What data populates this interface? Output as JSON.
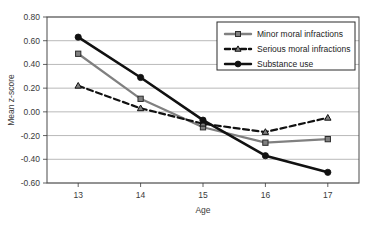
{
  "chart_data": {
    "type": "line",
    "title": "",
    "xlabel": "Age",
    "ylabel": "Mean z-score",
    "categories": [
      "13",
      "14",
      "15",
      "16",
      "17"
    ],
    "x": [
      13,
      14,
      15,
      16,
      17
    ],
    "xlim": [
      12.5,
      17.5
    ],
    "ylim": [
      -0.6,
      0.8
    ],
    "ytick_labels": [
      "0.80",
      "0.60",
      "0.40",
      "0.20",
      "0.00",
      "-0.20",
      "-0.40",
      "-0.60"
    ],
    "ytick_values": [
      0.8,
      0.6,
      0.4,
      0.2,
      0.0,
      -0.2,
      -0.4,
      -0.6
    ],
    "grid": "horizontal",
    "legend_position": "top-right",
    "series": [
      {
        "name": "Minor moral infractions",
        "values": [
          0.49,
          0.11,
          -0.13,
          -0.26,
          -0.23
        ],
        "color": "#808080",
        "marker": "square",
        "dash": "solid"
      },
      {
        "name": "Serious moral infractions",
        "values": [
          0.22,
          0.03,
          -0.1,
          -0.17,
          -0.05
        ],
        "color": "#111111",
        "marker": "triangle",
        "dash": "dashed"
      },
      {
        "name": "Substance use",
        "values": [
          0.63,
          0.29,
          -0.07,
          -0.37,
          -0.51
        ],
        "color": "#111111",
        "marker": "circle",
        "dash": "solid"
      }
    ]
  },
  "legend": {
    "items": [
      {
        "label": "Minor moral infractions"
      },
      {
        "label": "Serious moral infractions"
      },
      {
        "label": "Substance use"
      }
    ]
  },
  "axes": {
    "x_title": "Age",
    "y_title": "Mean z-score"
  }
}
